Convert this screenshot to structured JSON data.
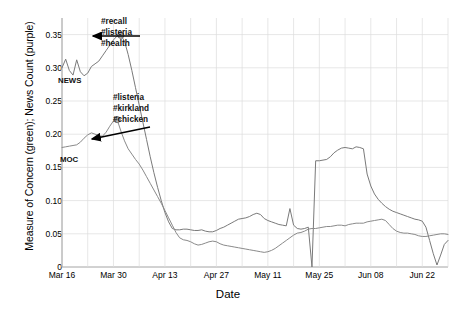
{
  "chart_data": {
    "type": "line",
    "title": "",
    "xlabel": "Date",
    "ylabel": "Measure of Concern (green); News Count (purple)",
    "grid": true,
    "legend_position": "inline-labels",
    "xlim": [
      "Mar 16",
      "Jun 29"
    ],
    "ylim": [
      0,
      0.375
    ],
    "yticks": [
      "0",
      "0.05",
      "0.10",
      "0.15",
      "0.20",
      "0.25",
      "0.30",
      "0.35"
    ],
    "ytick_values": [
      0,
      0.05,
      0.1,
      0.15,
      0.2,
      0.25,
      0.3,
      0.35
    ],
    "xticks": [
      "Mar 16",
      "Mar 30",
      "Apr 13",
      "Apr 27",
      "May 11",
      "May 25",
      "Jun 08",
      "Jun 22"
    ],
    "xtick_day_offsets": [
      0,
      14,
      28,
      42,
      56,
      70,
      84,
      98
    ],
    "series": [
      {
        "name": "NEWS",
        "color": "#7a7a7a",
        "inline_label": "NEWS",
        "x": [
          0,
          1,
          2,
          3,
          4,
          5,
          6,
          7,
          8,
          9,
          10,
          11,
          12,
          13,
          14,
          15,
          16,
          17,
          18,
          19,
          20,
          21,
          22,
          23,
          24,
          25,
          26,
          27,
          28,
          29,
          30,
          31,
          32,
          33,
          34,
          35,
          36,
          37,
          38,
          39,
          40,
          41,
          42,
          43,
          44,
          45,
          46,
          47,
          48,
          49,
          50,
          51,
          52,
          53,
          54,
          55,
          56,
          57,
          58,
          59,
          60,
          61,
          62,
          63,
          64,
          65,
          66,
          67,
          68,
          69,
          70,
          71,
          72,
          73,
          74,
          75,
          76,
          77,
          78,
          79,
          80,
          81,
          82,
          83,
          84,
          85,
          86,
          87,
          88,
          89,
          90,
          91,
          92,
          93,
          94,
          95,
          96,
          97,
          98,
          99,
          100,
          101,
          102,
          103,
          104,
          105
        ],
        "y": [
          0.3,
          0.313,
          0.296,
          0.289,
          0.312,
          0.294,
          0.288,
          0.292,
          0.302,
          0.306,
          0.31,
          0.318,
          0.326,
          0.334,
          0.342,
          0.348,
          0.349,
          0.34,
          0.32,
          0.296,
          0.27,
          0.244,
          0.218,
          0.192,
          0.166,
          0.142,
          0.12,
          0.1,
          0.082,
          0.068,
          0.058,
          0.056,
          0.056,
          0.057,
          0.057,
          0.056,
          0.055,
          0.055,
          0.056,
          0.054,
          0.053,
          0.053,
          0.055,
          0.058,
          0.06,
          0.063,
          0.066,
          0.069,
          0.072,
          0.073,
          0.074,
          0.076,
          0.079,
          0.081,
          0.079,
          0.073,
          0.07,
          0.068,
          0.066,
          0.064,
          0.063,
          0.062,
          0.088,
          0.063,
          0.058,
          0.057,
          0.058,
          0.06,
          0.0,
          0.16,
          0.16,
          0.161,
          0.162,
          0.166,
          0.172,
          0.176,
          0.179,
          0.18,
          0.179,
          0.178,
          0.181,
          0.18,
          0.178,
          0.14,
          0.122,
          0.11,
          0.102,
          0.096,
          0.091,
          0.087,
          0.084,
          0.082,
          0.08,
          0.078,
          0.076,
          0.074,
          0.072,
          0.071,
          0.069,
          0.06,
          0.04,
          0.02,
          0.003,
          0.018,
          0.034,
          0.04
        ]
      },
      {
        "name": "MOC",
        "color": "#8a8a8a",
        "inline_label": "MOC",
        "x": [
          0,
          1,
          2,
          3,
          4,
          5,
          6,
          7,
          8,
          9,
          10,
          11,
          12,
          13,
          14,
          15,
          16,
          17,
          18,
          19,
          20,
          21,
          22,
          23,
          24,
          25,
          26,
          27,
          28,
          29,
          30,
          31,
          32,
          33,
          34,
          35,
          36,
          37,
          38,
          39,
          40,
          41,
          42,
          43,
          44,
          45,
          46,
          47,
          48,
          49,
          50,
          51,
          52,
          53,
          54,
          55,
          56,
          57,
          58,
          59,
          60,
          61,
          62,
          63,
          64,
          65,
          66,
          67,
          68,
          69,
          70,
          71,
          72,
          73,
          74,
          75,
          76,
          77,
          78,
          79,
          80,
          81,
          82,
          83,
          84,
          85,
          86,
          87,
          88,
          89,
          90,
          91,
          92,
          93,
          94,
          95,
          96,
          97,
          98,
          99,
          100,
          101,
          102,
          103,
          104,
          105
        ],
        "y": [
          0.18,
          0.181,
          0.182,
          0.183,
          0.184,
          0.188,
          0.194,
          0.199,
          0.202,
          0.2,
          0.198,
          0.197,
          0.203,
          0.212,
          0.22,
          0.222,
          0.205,
          0.19,
          0.178,
          0.17,
          0.162,
          0.155,
          0.146,
          0.136,
          0.126,
          0.116,
          0.106,
          0.096,
          0.085,
          0.074,
          0.063,
          0.052,
          0.044,
          0.041,
          0.04,
          0.038,
          0.035,
          0.033,
          0.034,
          0.036,
          0.038,
          0.039,
          0.038,
          0.035,
          0.033,
          0.032,
          0.031,
          0.03,
          0.029,
          0.028,
          0.027,
          0.026,
          0.025,
          0.024,
          0.023,
          0.022,
          0.023,
          0.025,
          0.028,
          0.032,
          0.036,
          0.04,
          0.044,
          0.048,
          0.051,
          0.052,
          0.054,
          0.057,
          0.058,
          0.058,
          0.059,
          0.06,
          0.061,
          0.061,
          0.062,
          0.063,
          0.063,
          0.062,
          0.064,
          0.065,
          0.066,
          0.066,
          0.066,
          0.068,
          0.069,
          0.07,
          0.071,
          0.072,
          0.07,
          0.064,
          0.058,
          0.054,
          0.052,
          0.051,
          0.051,
          0.05,
          0.049,
          0.047,
          0.046,
          0.046,
          0.047,
          0.048,
          0.049,
          0.05,
          0.05,
          0.049
        ]
      }
    ],
    "markers": [
      {
        "name": "news-peak-marker",
        "x": 16,
        "y": 0.349
      },
      {
        "name": "moc-peak-marker",
        "x": 15,
        "y": 0.222
      }
    ],
    "annotations": [
      {
        "name": "news-peak-annotation",
        "lines": [
          "#recall",
          "#listeria",
          "#health"
        ],
        "text_left_px": 101,
        "text_top_px": 17,
        "arrow": {
          "x1": 140,
          "y1": 36,
          "x2": 93,
          "y2": 36
        }
      },
      {
        "name": "moc-peak-annotation",
        "lines": [
          "#listeria",
          "#kirkland",
          "#chicken"
        ],
        "text_left_px": 113,
        "text_top_px": 93,
        "arrow": {
          "x1": 150,
          "y1": 127,
          "x2": 92,
          "y2": 139
        }
      }
    ],
    "inline_series_labels": [
      {
        "name": "news-series-label",
        "text": "NEWS",
        "left_px": 58,
        "top_px": 76
      },
      {
        "name": "moc-series-label",
        "text": "MOC",
        "left_px": 60,
        "top_px": 155
      }
    ]
  }
}
